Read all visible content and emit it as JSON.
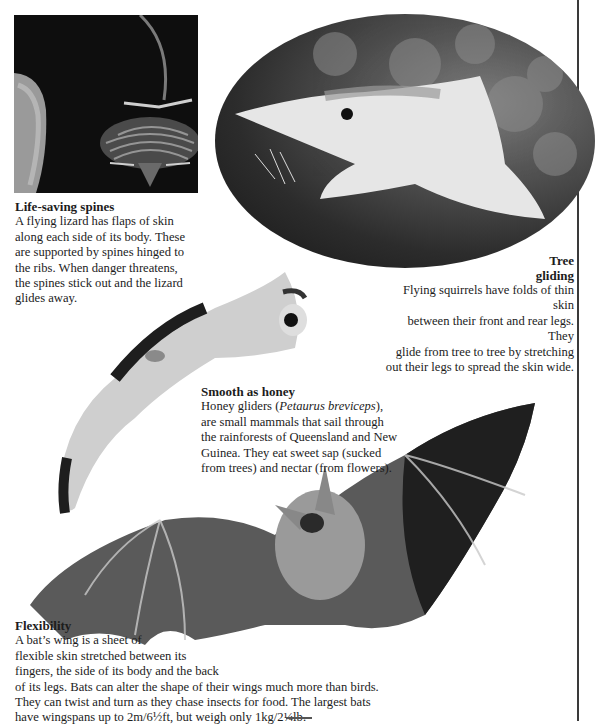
{
  "page": {
    "border_color": "#3a3a3a"
  },
  "images": {
    "lizard": {
      "subject": "flying lizard gliding with spines extended"
    },
    "squirrel": {
      "subject": "flying squirrel gliding, oval vignette"
    },
    "glider": {
      "subject": "honey glider (sugar glider) in flight"
    },
    "bat": {
      "subject": "bat with wings outstretched"
    }
  },
  "captions": {
    "lizard": {
      "title": "Life-saving spines",
      "body": "A flying lizard has flaps of skin along each side of its body. These are supported by spines hinged to the ribs. When danger threatens, the spines stick out and the lizard glides away."
    },
    "squirrel": {
      "title_line1": "Tree",
      "title_line2": "gliding",
      "body_lines": [
        "Flying squirrels have folds of thin skin",
        "between their front and rear legs. They",
        "glide from tree to tree by stretching",
        "out their legs to spread the skin wide."
      ]
    },
    "glider": {
      "title": "Smooth as honey",
      "body_before": "Honey gliders (",
      "body_italic": "Petaurus breviceps",
      "body_after": "), are small mammals that sail through the rainforests of Queensland and New Guinea. They eat sweet sap (sucked from trees) and nectar (from flowers)."
    },
    "bat": {
      "title": "Flexibility",
      "body_lines": [
        "A bat’s wing is a sheet of",
        "flexible skin stretched between its",
        "fingers, the side of its body and the back",
        "of its legs. Bats can alter the shape of their wings much more than birds.",
        "They can twist and turn as they chase insects for food. The largest bats",
        "have wingspans up to 2m/6½ft, but weigh only 1kg/2¼lb."
      ]
    }
  }
}
